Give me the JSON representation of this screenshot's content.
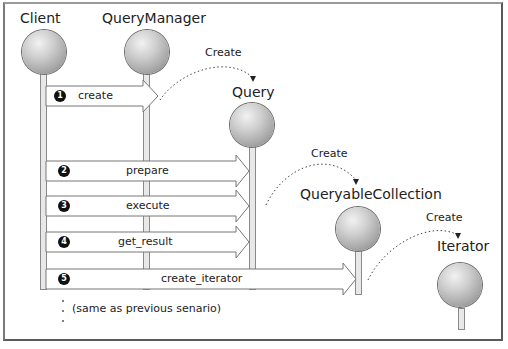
{
  "diagram": {
    "type": "sequence",
    "objects": [
      {
        "name": "Client"
      },
      {
        "name": "QueryManager"
      },
      {
        "name": "Query"
      },
      {
        "name": "QueryableCollection"
      },
      {
        "name": "Iterator"
      }
    ],
    "messages": [
      {
        "num": "1",
        "label": "create",
        "from": "Client",
        "to": "QueryManager"
      },
      {
        "num": "2",
        "label": "prepare",
        "from": "Client",
        "to": "Query"
      },
      {
        "num": "3",
        "label": "execute",
        "from": "Client",
        "to": "Query"
      },
      {
        "num": "4",
        "label": "get_result",
        "from": "Client",
        "to": "Query"
      },
      {
        "num": "5",
        "label": "create_iterator",
        "from": "Client",
        "to": "QueryableCollection"
      }
    ],
    "create_annotations": [
      {
        "label": "Create",
        "from": "QueryManager",
        "to": "Query"
      },
      {
        "label": "Create",
        "from": "Query",
        "to": "QueryableCollection"
      },
      {
        "label": "Create",
        "from": "QueryableCollection",
        "to": "Iterator"
      }
    ],
    "note": "(same as previous senario)"
  }
}
